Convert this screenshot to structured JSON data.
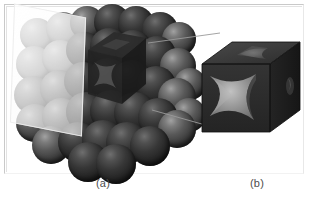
{
  "figure": {
    "kind": "crystal-structure-illustration",
    "background_color": "#ffffff",
    "border_color": "#c9c9c9"
  },
  "captions": {
    "panel_a": "(a)",
    "panel_b": "(b)"
  },
  "panel_a": {
    "name": "close-packed-sphere-cluster",
    "sphere_color_light": "#8d8d8d",
    "sphere_color_dark": "#1e1e1e",
    "cut_plane_color": "#fbfbfb",
    "unit_cell_color": "#2a2a2a",
    "rows": [
      {
        "row": 1,
        "spheres": 7
      },
      {
        "row": 2,
        "spheres": 8
      },
      {
        "row": 3,
        "spheres": 8
      },
      {
        "row": 4,
        "spheres": 7
      },
      {
        "row": 5,
        "spheres": 6
      }
    ],
    "spheres": [
      {
        "x": 14,
        "y": 16,
        "d": 34,
        "shade": "pale"
      },
      {
        "x": 40,
        "y": 10,
        "d": 34,
        "shade": "pale"
      },
      {
        "x": 64,
        "y": 4,
        "d": 34,
        "shade": "mid"
      },
      {
        "x": 88,
        "y": 2,
        "d": 36,
        "shade": "dark"
      },
      {
        "x": 112,
        "y": 4,
        "d": 36,
        "shade": "dark"
      },
      {
        "x": 136,
        "y": 10,
        "d": 36,
        "shade": "dark"
      },
      {
        "x": 156,
        "y": 20,
        "d": 34,
        "shade": "mid"
      },
      {
        "x": 10,
        "y": 44,
        "d": 36,
        "shade": "pale"
      },
      {
        "x": 36,
        "y": 38,
        "d": 36,
        "shade": "pale"
      },
      {
        "x": 60,
        "y": 30,
        "d": 36,
        "shade": "dark"
      },
      {
        "x": 84,
        "y": 26,
        "d": 38,
        "shade": "dark"
      },
      {
        "x": 108,
        "y": 28,
        "d": 38,
        "shade": "dark"
      },
      {
        "x": 132,
        "y": 34,
        "d": 38,
        "shade": "dark"
      },
      {
        "x": 154,
        "y": 46,
        "d": 36,
        "shade": "mid"
      },
      {
        "x": 168,
        "y": 66,
        "d": 32,
        "shade": "mid"
      },
      {
        "x": 8,
        "y": 74,
        "d": 38,
        "shade": "mid"
      },
      {
        "x": 34,
        "y": 68,
        "d": 38,
        "shade": "mid"
      },
      {
        "x": 58,
        "y": 60,
        "d": 38,
        "shade": "dark"
      },
      {
        "x": 82,
        "y": 56,
        "d": 40,
        "shade": "dark"
      },
      {
        "x": 106,
        "y": 58,
        "d": 40,
        "shade": "dark"
      },
      {
        "x": 130,
        "y": 64,
        "d": 40,
        "shade": "dark"
      },
      {
        "x": 152,
        "y": 76,
        "d": 38,
        "shade": "mid"
      },
      {
        "x": 166,
        "y": 96,
        "d": 34,
        "shade": "mid"
      },
      {
        "x": 10,
        "y": 102,
        "d": 38,
        "shade": "mid"
      },
      {
        "x": 36,
        "y": 96,
        "d": 38,
        "shade": "mid"
      },
      {
        "x": 60,
        "y": 90,
        "d": 40,
        "shade": "dark"
      },
      {
        "x": 84,
        "y": 88,
        "d": 42,
        "shade": "dark"
      },
      {
        "x": 108,
        "y": 90,
        "d": 42,
        "shade": "dark"
      },
      {
        "x": 132,
        "y": 96,
        "d": 40,
        "shade": "dark"
      },
      {
        "x": 152,
        "y": 108,
        "d": 38,
        "shade": "mid"
      },
      {
        "x": 26,
        "y": 124,
        "d": 38,
        "shade": "mid"
      },
      {
        "x": 52,
        "y": 120,
        "d": 40,
        "shade": "dark"
      },
      {
        "x": 76,
        "y": 118,
        "d": 42,
        "shade": "dark"
      },
      {
        "x": 100,
        "y": 120,
        "d": 42,
        "shade": "dark"
      },
      {
        "x": 124,
        "y": 124,
        "d": 40,
        "shade": "dark"
      },
      {
        "x": 62,
        "y": 140,
        "d": 40,
        "shade": "dark"
      },
      {
        "x": 90,
        "y": 142,
        "d": 40,
        "shade": "dark"
      }
    ]
  },
  "panel_b": {
    "name": "unit-cell-cube",
    "cube_color": "#2e2e2e",
    "cube_top_color": "#3a3a3a",
    "cube_side_color": "#202020",
    "carved_face_color": "#9b9b9b",
    "description_faces": [
      "front",
      "top",
      "right"
    ]
  },
  "connectors": {
    "count": 2,
    "color": "#9a9a9a",
    "lines": [
      {
        "x1": 148,
        "y1": 43,
        "x2": 220,
        "y2": 33
      },
      {
        "x1": 152,
        "y1": 110,
        "x2": 216,
        "y2": 128
      }
    ]
  }
}
